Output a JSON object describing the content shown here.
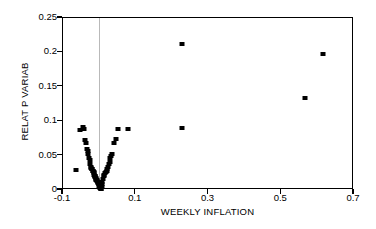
{
  "chart_data": {
    "type": "scatter",
    "title": "",
    "xlabel": "WEEKLY INFLATION",
    "ylabel": "RELAT P VARIAB",
    "xlim": [
      -0.1,
      0.7
    ],
    "ylim": [
      0.0,
      0.25
    ],
    "xticks": [
      -0.1,
      0.1,
      0.3,
      0.5,
      0.7
    ],
    "xtick_labels": [
      "-0.1",
      "0.1",
      "0.3",
      "0.5",
      "0.7"
    ],
    "yticks": [
      0.0,
      0.05,
      0.1,
      0.15,
      0.2,
      0.25
    ],
    "ytick_labels": [
      "0",
      "0.05",
      "0.1",
      "0.15",
      "0.2",
      "0.25"
    ],
    "grid": false,
    "gridlines_vertical": [
      0.0
    ],
    "legend": null,
    "marker": "square",
    "marker_color": "#000000",
    "series": [
      {
        "name": "observations",
        "x": [
          -0.064,
          -0.052,
          -0.046,
          -0.041,
          -0.039,
          -0.036,
          -0.034,
          -0.032,
          -0.03,
          -0.028,
          -0.027,
          -0.025,
          -0.024,
          -0.022,
          -0.021,
          -0.02,
          -0.018,
          -0.017,
          -0.016,
          -0.015,
          -0.014,
          -0.013,
          -0.012,
          -0.011,
          -0.01,
          -0.009,
          -0.008,
          -0.007,
          -0.006,
          -0.005,
          -0.004,
          -0.003,
          -0.002,
          -0.001,
          0.0,
          0.001,
          0.002,
          0.003,
          0.004,
          0.005,
          0.006,
          0.007,
          0.008,
          0.01,
          0.012,
          0.014,
          0.016,
          0.018,
          0.02,
          0.022,
          0.024,
          0.026,
          0.028,
          0.03,
          0.033,
          0.036,
          0.04,
          0.046,
          0.052,
          0.08,
          0.228,
          0.228,
          0.565,
          0.615
        ],
        "y": [
          0.029,
          0.087,
          0.092,
          0.088,
          0.073,
          0.068,
          0.06,
          0.056,
          0.053,
          0.046,
          0.043,
          0.038,
          0.034,
          0.032,
          0.031,
          0.03,
          0.028,
          0.027,
          0.026,
          0.024,
          0.022,
          0.021,
          0.02,
          0.019,
          0.018,
          0.016,
          0.015,
          0.014,
          0.013,
          0.012,
          0.011,
          0.01,
          0.009,
          0.008,
          0.006,
          0.005,
          0.004,
          0.003,
          0.002,
          0.001,
          0.004,
          0.008,
          0.012,
          0.016,
          0.02,
          0.022,
          0.024,
          0.026,
          0.028,
          0.031,
          0.034,
          0.038,
          0.041,
          0.046,
          0.05,
          0.052,
          0.069,
          0.074,
          0.088,
          0.089,
          0.09,
          0.212,
          0.134,
          0.198
        ]
      }
    ]
  }
}
